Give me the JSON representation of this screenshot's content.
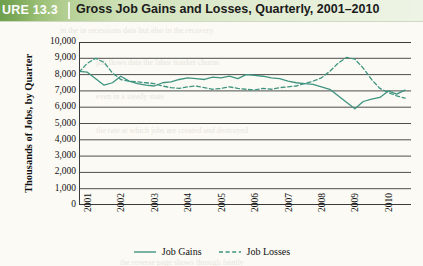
{
  "header": {
    "figure_number": "URE 13.3",
    "title": "Gross Job Gains and Losses, Quarterly, 2001–2010"
  },
  "axes": {
    "y_title": "Thousands of Jobs, by Quarter",
    "y_ticks": [
      "10,000",
      "9,000",
      "8,000",
      "7,000",
      "6,000",
      "5,000",
      "4,000",
      "3,000",
      "2,000",
      "1,000",
      "0"
    ],
    "x_ticks": [
      "2001",
      "2002",
      "2003",
      "2004",
      "2005",
      "2006",
      "2007",
      "2008",
      "2009",
      "2010"
    ]
  },
  "legend": {
    "gains_label": "Job Gains",
    "losses_label": "Job Losses"
  },
  "colors": {
    "series": "#3f9480",
    "grid": "#3a3a3a",
    "header_dark": "#6ea04e",
    "header_light": "#eef4e6",
    "page": "#fbfaf5"
  },
  "bleed_text": [
    "the reverse page shows through faintly",
    "in the in recessions data but also in the recovery",
    "job flows data the labor market churns",
    "even in a steady state",
    "the rate at which jobs are created and destroyed"
  ],
  "chart_data": {
    "type": "line",
    "title": "Gross Job Gains and Losses, Quarterly, 2001–2010",
    "xlabel": "",
    "ylabel": "Thousands of Jobs, by Quarter",
    "ylim": [
      0,
      10000
    ],
    "ytick_step": 1000,
    "grid": true,
    "legend_position": "bottom-center",
    "x": [
      "2001Q1",
      "2001Q2",
      "2001Q3",
      "2001Q4",
      "2002Q1",
      "2002Q2",
      "2002Q3",
      "2002Q4",
      "2003Q1",
      "2003Q2",
      "2003Q3",
      "2003Q4",
      "2004Q1",
      "2004Q2",
      "2004Q3",
      "2004Q4",
      "2005Q1",
      "2005Q2",
      "2005Q3",
      "2005Q4",
      "2006Q1",
      "2006Q2",
      "2006Q3",
      "2006Q4",
      "2007Q1",
      "2007Q2",
      "2007Q3",
      "2007Q4",
      "2008Q1",
      "2008Q2",
      "2008Q3",
      "2008Q4",
      "2009Q1",
      "2009Q2",
      "2009Q3",
      "2009Q4",
      "2010Q1",
      "2010Q2",
      "2010Q3",
      "2010Q4"
    ],
    "series": [
      {
        "name": "Job Gains",
        "style": "solid",
        "color": "#3f9480",
        "values": [
          8200,
          8150,
          7750,
          7350,
          7500,
          7900,
          7600,
          7450,
          7350,
          7300,
          7500,
          7550,
          7700,
          7800,
          7750,
          7700,
          7850,
          7800,
          7900,
          7750,
          8000,
          7950,
          7900,
          7800,
          7750,
          7600,
          7500,
          7450,
          7400,
          7250,
          7100,
          6700,
          6300,
          5900,
          6350,
          6500,
          6600,
          7000,
          6800,
          7050
        ]
      },
      {
        "name": "Job Losses",
        "style": "dashed",
        "color": "#3f9480",
        "values": [
          8150,
          8700,
          9000,
          8750,
          8100,
          7700,
          7600,
          7550,
          7500,
          7450,
          7300,
          7200,
          7150,
          7250,
          7300,
          7200,
          7100,
          7150,
          7250,
          7150,
          7100,
          7050,
          7150,
          7100,
          7200,
          7250,
          7300,
          7450,
          7600,
          7800,
          8200,
          8700,
          9050,
          8950,
          8400,
          7700,
          7150,
          6900,
          6700,
          6550
        ]
      }
    ]
  }
}
